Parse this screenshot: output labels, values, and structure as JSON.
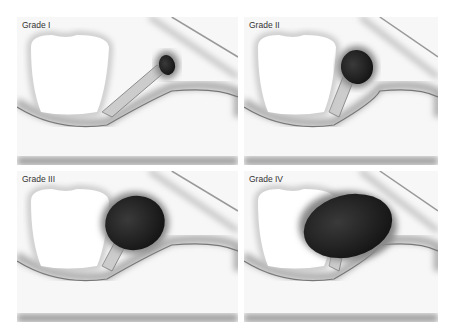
{
  "panels": [
    {
      "label": "Grade I",
      "x": 17,
      "y": 17,
      "w": 221,
      "h": 148,
      "mass_rx": 8,
      "mass_ry": 10,
      "mass_cx": 150,
      "mass_cy": 48
    },
    {
      "label": "Grade II",
      "x": 244,
      "y": 17,
      "w": 194,
      "h": 148,
      "mass_rx": 16,
      "mass_ry": 17,
      "mass_cx": 113,
      "mass_cy": 50
    },
    {
      "label": "Grade III",
      "x": 17,
      "y": 171,
      "w": 221,
      "h": 151,
      "mass_rx": 30,
      "mass_ry": 27,
      "mass_cx": 118,
      "mass_cy": 52
    },
    {
      "label": "Grade IV",
      "x": 244,
      "y": 171,
      "w": 194,
      "h": 151,
      "mass_rx": 45,
      "mass_ry": 31,
      "mass_cx": 104,
      "mass_cy": 55
    }
  ]
}
